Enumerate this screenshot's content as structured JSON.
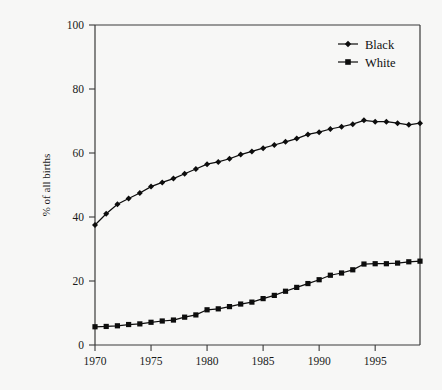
{
  "chart_data": {
    "type": "line",
    "title": "",
    "subtitle": "",
    "xlabel": "",
    "ylabel": "% of all births",
    "xlim": [
      1970,
      1999
    ],
    "ylim": [
      0,
      100
    ],
    "grid": false,
    "legend_position": "top-right",
    "x_ticks": [
      "1970",
      "1975",
      "1980",
      "1985",
      "1990",
      "1995"
    ],
    "x_tick_values": [
      1970,
      1975,
      1980,
      1985,
      1990,
      1995
    ],
    "y_ticks": [
      "0",
      "20",
      "40",
      "60",
      "80",
      "100"
    ],
    "y_tick_values": [
      0,
      20,
      40,
      60,
      80,
      100
    ],
    "x": [
      1970,
      1971,
      1972,
      1973,
      1974,
      1975,
      1976,
      1977,
      1978,
      1979,
      1980,
      1981,
      1982,
      1983,
      1984,
      1985,
      1986,
      1987,
      1988,
      1989,
      1990,
      1991,
      1992,
      1993,
      1994,
      1995,
      1996,
      1997,
      1998,
      1999
    ],
    "series": [
      {
        "name": "Black",
        "marker": "diamond",
        "color": "#0d0d0d",
        "values": [
          37.5,
          41.0,
          44.0,
          45.8,
          47.5,
          49.5,
          50.8,
          52.0,
          53.5,
          55.0,
          56.5,
          57.2,
          58.2,
          59.5,
          60.5,
          61.5,
          62.5,
          63.5,
          64.5,
          65.8,
          66.5,
          67.5,
          68.2,
          69.0,
          70.2,
          69.8,
          69.8,
          69.3,
          68.8,
          69.3
        ]
      },
      {
        "name": "White",
        "marker": "square",
        "color": "#0d0d0d",
        "values": [
          5.7,
          5.8,
          6.0,
          6.4,
          6.6,
          7.1,
          7.5,
          7.8,
          8.7,
          9.4,
          11.0,
          11.3,
          12.0,
          12.8,
          13.4,
          14.5,
          15.5,
          16.8,
          18.0,
          19.2,
          20.4,
          21.8,
          22.5,
          23.5,
          25.3,
          25.4,
          25.4,
          25.6,
          26.0,
          26.2
        ]
      }
    ]
  }
}
